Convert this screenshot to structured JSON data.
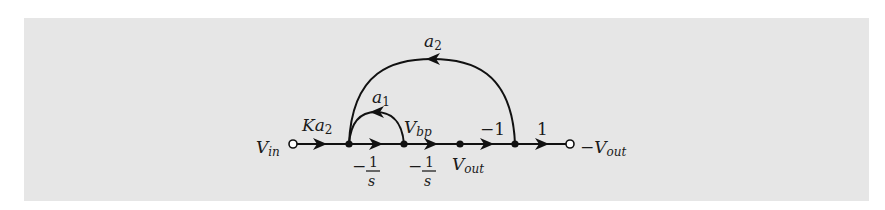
{
  "diagram": {
    "type": "signal-flow-graph",
    "background_color": "#e6e6e6",
    "line_color": "#111111",
    "nodes": [
      {
        "id": "vin",
        "label_main": "V",
        "label_sub": "in",
        "kind": "source-open-circle"
      },
      {
        "id": "n1",
        "label_main": "",
        "label_sub": "",
        "kind": "filled-node"
      },
      {
        "id": "vbp",
        "label_main": "V",
        "label_sub": "bp",
        "kind": "filled-node"
      },
      {
        "id": "vout",
        "label_main": "V",
        "label_sub": "out",
        "kind": "filled-node"
      },
      {
        "id": "n4",
        "label_main": "",
        "label_sub": "",
        "kind": "filled-node"
      },
      {
        "id": "neg_vout",
        "label_prefix": "−",
        "label_main": "V",
        "label_sub": "out",
        "kind": "sink-open-circle"
      }
    ],
    "edges": [
      {
        "from": "vin",
        "to": "n1",
        "gain_main": "Ka",
        "gain_sub": "2"
      },
      {
        "from": "n1",
        "to": "vbp",
        "gain_sign": "−",
        "gain_num": "1",
        "gain_den": "s"
      },
      {
        "from": "vbp",
        "to": "vout",
        "gain_sign": "−",
        "gain_num": "1",
        "gain_den": "s"
      },
      {
        "from": "vout",
        "to": "n4",
        "gain": "−1"
      },
      {
        "from": "n4",
        "to": "neg_vout",
        "gain": "1"
      },
      {
        "from": "vbp",
        "to": "n1",
        "gain_main": "a",
        "gain_sub": "1",
        "kind": "feedback-arc-small"
      },
      {
        "from": "n4",
        "to": "n1",
        "gain_main": "a",
        "gain_sub": "2",
        "kind": "feedback-arc-large"
      }
    ]
  }
}
